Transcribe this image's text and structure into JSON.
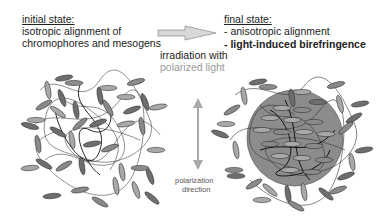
{
  "initial": {
    "heading": "initial state:",
    "line1": "isotropic alignment of",
    "line2": "chromophores and mesogens"
  },
  "final": {
    "heading": "final state:",
    "line1": "- anisotropic alignment",
    "line2": "- light-induced birefringence"
  },
  "process": {
    "line1": "irradiation with",
    "line2": "polarized light"
  },
  "polarization": {
    "line1": "polarization",
    "line2": "direction"
  },
  "colors": {
    "mesogen_dark": "#6e6e6e",
    "mesogen_light": "#a8a8a8",
    "ordered_domain": "#8c8c8c",
    "arrow": "#bdbdbd",
    "gray_text": "#9a9a9a"
  }
}
